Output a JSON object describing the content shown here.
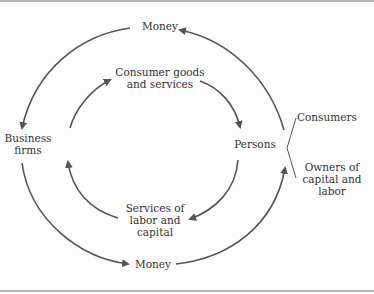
{
  "diagram": {
    "nodes": {
      "business_firms": "Business\nfirms",
      "persons": "Persons"
    },
    "flows": {
      "money_top": "Money",
      "consumer_goods": "Consumer goods\nand services",
      "services_labor": "Services of\nlabor and\ncapital",
      "money_bottom": "Money"
    },
    "persons_roles": {
      "consumers": "Consumers",
      "owners": "Owners of\ncapital and\nlabor"
    },
    "colors": {
      "arrow": "#555555",
      "text": "#333333",
      "rule": "#b5b5b5"
    }
  }
}
